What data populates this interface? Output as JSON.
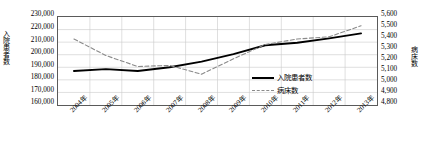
{
  "chart_data": {
    "type": "line",
    "title": "",
    "xlabel": "",
    "categories": [
      "2004年",
      "2005年",
      "2006年",
      "2007年",
      "2008年",
      "2009年",
      "2010年",
      "2011年",
      "2012年",
      "2013年"
    ],
    "grid": true,
    "legend_position": "inside-bottom-right",
    "axes": {
      "left": {
        "label": "入院患者数",
        "ticks": [
          "160,000",
          "170,000",
          "180,000",
          "190,000",
          "200,000",
          "210,000",
          "220,000",
          "230,000"
        ],
        "min": 160000,
        "max": 230000,
        "step": 10000
      },
      "right": {
        "label": "病床数",
        "ticks": [
          "4,800",
          "4,900",
          "5,000",
          "5,100",
          "5,200",
          "5,300",
          "5,400",
          "5,500",
          "5,600"
        ],
        "min": 4800,
        "max": 5600,
        "step": 100
      }
    },
    "series": [
      {
        "name": "入院患者数",
        "axis": "left",
        "style": "solid",
        "color": "#000000",
        "values": [
          187000,
          188500,
          187000,
          190000,
          194500,
          200500,
          207500,
          209500,
          213000,
          217000
        ]
      },
      {
        "name": "病床数",
        "axis": "right",
        "style": "dashed",
        "color": "#8a8a8a",
        "values": [
          5400,
          5250,
          5150,
          5160,
          5080,
          5220,
          5350,
          5400,
          5420,
          5520
        ]
      }
    ]
  },
  "legend": {
    "items": [
      {
        "label": "入院患者数",
        "style": "solid"
      },
      {
        "label": "病床数",
        "style": "dashed"
      }
    ]
  }
}
